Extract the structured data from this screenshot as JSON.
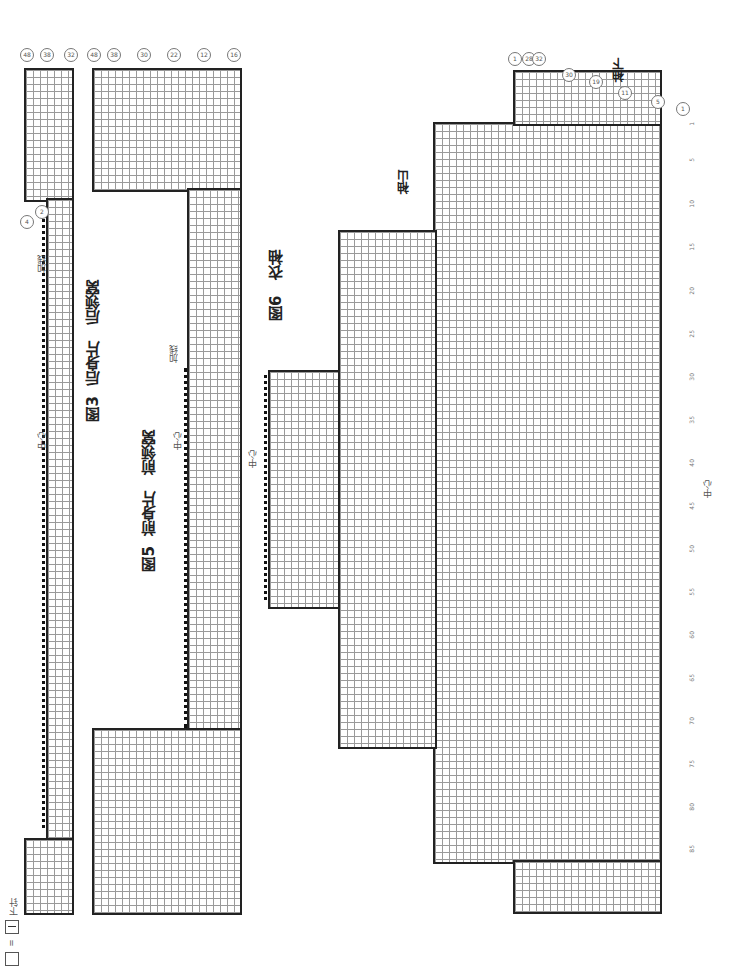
{
  "figures": [
    {
      "id": "fig3",
      "title": "图3",
      "name": "后身片",
      "subtitle": "后领窝",
      "center_label": "中心",
      "increase_label": "加线",
      "row_markers": [
        "48",
        "38",
        "32",
        "2",
        "4",
        "4",
        "2",
        "38",
        "48"
      ]
    },
    {
      "id": "fig5",
      "title": "图5",
      "name": "前身片",
      "subtitle": "前领窝",
      "center_label": "中心",
      "increase_label": "加线",
      "row_markers": [
        "48",
        "38",
        "30",
        "22",
        "12",
        "16",
        "2",
        "4",
        "6",
        "2",
        "8",
        "12",
        "16",
        "20",
        "30",
        "38",
        "48"
      ]
    },
    {
      "id": "fig6",
      "title": "图6",
      "name": "衣袖",
      "cap_label": "袖山",
      "underarm_label": "袖下",
      "center_label": "中心",
      "top_markers": [
        "1",
        "28",
        "32",
        "30",
        "19",
        "11",
        "5",
        "1"
      ],
      "cap_markers": [
        "3",
        "11",
        "15",
        "18",
        "22",
        "26",
        "30",
        "40",
        "48"
      ],
      "row_numbers": [
        "1",
        "5",
        "10",
        "15",
        "20",
        "25",
        "30",
        "35",
        "40",
        "45",
        "50",
        "55",
        "60",
        "65",
        "70",
        "75",
        "80",
        "85"
      ]
    }
  ],
  "legend": {
    "symbol_blank": "□",
    "equals": "=",
    "symbol_knit": "|",
    "label": "下针"
  },
  "stitch_symbols": {
    "yarn_over": "○",
    "k2tog": "⋌",
    "ssk": "⋋",
    "knit": "|"
  }
}
